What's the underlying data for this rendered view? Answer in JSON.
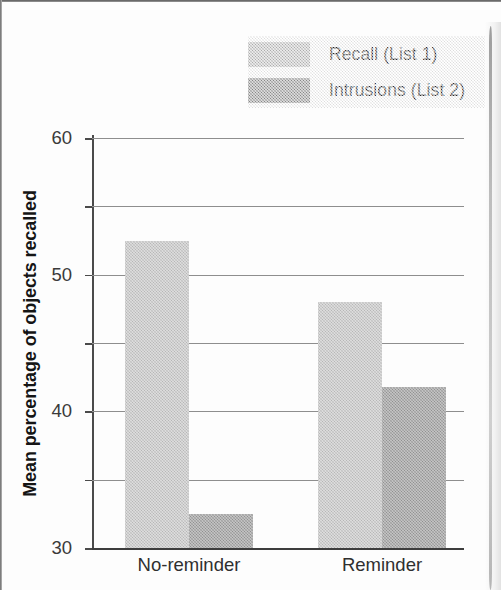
{
  "chart_data": {
    "type": "bar",
    "title": "",
    "xlabel": "",
    "ylabel": "Mean percentage of objects recalled",
    "categories": [
      "No-reminder",
      "Reminder"
    ],
    "series": [
      {
        "name": "Recall (List 1)",
        "values": [
          45,
          36
        ],
        "color": "#c3c3c3"
      },
      {
        "name": "Intrusions (List 2)",
        "values": [
          5,
          23.5
        ],
        "color": "#9a9a9a"
      }
    ],
    "ylim": [
      0,
      60
    ],
    "yticks": [
      0,
      10,
      20,
      30,
      40,
      50,
      60
    ],
    "ytick_labels": [
      "0",
      "10",
      "20",
      "30",
      "40",
      "50",
      "60"
    ],
    "grid": true,
    "legend_position": "top-right"
  },
  "legend": {
    "items": [
      {
        "label": "Recall (List 1)",
        "color": "#c3c3c3"
      },
      {
        "label": "Intrusions (List 2)",
        "color": "#9a9a9a"
      }
    ]
  },
  "axes": {
    "y_title": "Mean percentage of objects recalled"
  }
}
